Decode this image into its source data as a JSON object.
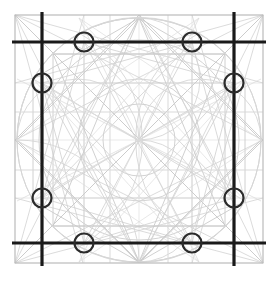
{
  "figure": {
    "background_color": "#ffffff",
    "width": 278,
    "height": 286
  },
  "palette": {
    "heavy_line": "#1a1a1a",
    "light_line": "#c9c9c9",
    "faint_line": "#d8d8d8",
    "frame_line": "#b8b8b8",
    "circle_stroke": "#2b2b2b",
    "background": "#ffffff"
  },
  "frame": {
    "label": "outer-thin-square",
    "x": 15,
    "y": 15,
    "width": 248,
    "height": 248,
    "stroke_width": 1
  },
  "heavy_lines": {
    "stroke_width": 3.2,
    "vertical_x": [
      42,
      234
    ],
    "horizontal_y": [
      42,
      243
    ],
    "v_top": 12,
    "v_bottom": 266,
    "h_left": 12,
    "h_right": 266
  },
  "marker_circles": {
    "radius": 9.5,
    "stroke_width": 2.2,
    "points": [
      {
        "name": "top-left-marker",
        "cx": 84,
        "cy": 42
      },
      {
        "name": "top-right-marker",
        "cx": 192,
        "cy": 42
      },
      {
        "name": "left-upper-marker",
        "cx": 42,
        "cy": 83
      },
      {
        "name": "right-upper-marker",
        "cx": 234,
        "cy": 83
      },
      {
        "name": "left-lower-marker",
        "cx": 42,
        "cy": 198
      },
      {
        "name": "right-lower-marker",
        "cx": 234,
        "cy": 198
      },
      {
        "name": "bottom-left-marker",
        "cx": 84,
        "cy": 243
      },
      {
        "name": "bottom-right-marker",
        "cx": 192,
        "cy": 243
      }
    ]
  },
  "construction": {
    "main_circle": {
      "cx": 139,
      "cy": 140,
      "r": 122
    },
    "inner_circles": [
      {
        "cx": 139,
        "cy": 140,
        "r": 100
      },
      {
        "cx": 139,
        "cy": 140,
        "r": 61
      },
      {
        "cx": 139,
        "cy": 140,
        "r": 36
      }
    ],
    "grid_x": [
      15,
      42,
      84,
      110,
      139,
      168,
      192,
      234,
      263
    ],
    "grid_y": [
      15,
      42,
      83,
      112,
      140,
      170,
      198,
      243,
      263
    ],
    "node_count": 81,
    "arc_radius": 122,
    "polygon_sides": [
      4,
      6,
      8,
      12
    ],
    "description": "Dense web of chords, diagonals and arcs inscribed in a square with a circumscribed circle"
  },
  "chart_data": {
    "type": "scatter",
    "xlabel": "",
    "ylabel": "",
    "xlim": [
      15,
      263
    ],
    "ylim": [
      15,
      263
    ],
    "grid": true,
    "legend": "none",
    "categories": [
      "outer-frame",
      "heavy-axes",
      "marker-circles",
      "inscribed-circle",
      "chord-web"
    ],
    "values": [
      1,
      4,
      8,
      4,
      64
    ],
    "x": [
      84,
      192,
      42,
      234,
      42,
      234,
      84,
      192
    ],
    "y": [
      42,
      42,
      83,
      83,
      198,
      198,
      243,
      243
    ]
  }
}
